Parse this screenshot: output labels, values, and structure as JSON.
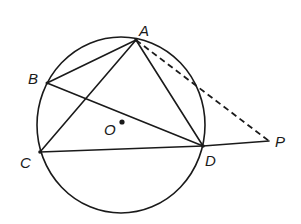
{
  "diagram": {
    "circle": {
      "center_label": "O",
      "cx": 121,
      "cy": 125,
      "rx": 84,
      "ry": 88
    },
    "points": {
      "A": {
        "label": "A",
        "x": 136,
        "y": 40
      },
      "B": {
        "label": "B",
        "x": 47,
        "y": 83
      },
      "C": {
        "label": "C",
        "x": 40,
        "y": 152
      },
      "D": {
        "label": "D",
        "x": 203,
        "y": 146
      },
      "P": {
        "label": "P",
        "x": 269,
        "y": 141
      },
      "O": {
        "label": "O",
        "x": 122,
        "y": 122
      }
    },
    "segments": [
      {
        "from": "A",
        "to": "B",
        "style": "solid"
      },
      {
        "from": "B",
        "to": "D",
        "style": "solid"
      },
      {
        "from": "A",
        "to": "C",
        "style": "solid"
      },
      {
        "from": "A",
        "to": "D",
        "style": "solid"
      },
      {
        "from": "C",
        "to": "D",
        "style": "solid"
      },
      {
        "from": "D",
        "to": "P",
        "style": "solid"
      },
      {
        "from": "A",
        "to": "P",
        "style": "dashed"
      }
    ],
    "labels": {
      "A": "A",
      "B": "B",
      "C": "C",
      "D": "D",
      "O": "O",
      "P": "P"
    },
    "colors": {
      "ink": "#1a1a1a",
      "background": "#ffffff"
    }
  }
}
